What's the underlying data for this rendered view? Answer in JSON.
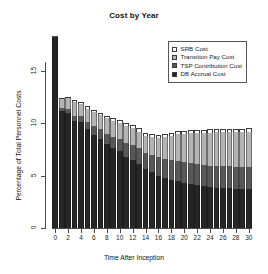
{
  "chart_data": {
    "type": "bar",
    "title": "Cost by Year",
    "xlabel": "Time After Inception",
    "ylabel": "Percentage of Total Personnel Costs",
    "stacked": true,
    "grid": false,
    "legend_position": "top-right",
    "xlim": [
      0,
      30
    ],
    "ylim": [
      0,
      18.6
    ],
    "ytick_labels": [
      "0",
      "5",
      "10",
      "15"
    ],
    "ytick_values": [
      0,
      5,
      10,
      15
    ],
    "xtick_labels": [
      "0",
      "2",
      "4",
      "6",
      "8",
      "10",
      "12",
      "14",
      "16",
      "18",
      "20",
      "22",
      "24",
      "26",
      "28",
      "30"
    ],
    "xtick_values": [
      0,
      2,
      4,
      6,
      8,
      10,
      12,
      14,
      16,
      18,
      20,
      22,
      24,
      26,
      28,
      30
    ],
    "categories": [
      0,
      1,
      2,
      3,
      4,
      5,
      6,
      7,
      8,
      9,
      10,
      11,
      12,
      13,
      14,
      15,
      16,
      17,
      18,
      19,
      20,
      21,
      22,
      23,
      24,
      25,
      26,
      27,
      28,
      29,
      30
    ],
    "series": [
      {
        "name": "DB Accrual Cost",
        "color": "#262626",
        "values": [
          18.2,
          11.2,
          11.0,
          10.2,
          10.1,
          9.4,
          8.9,
          8.5,
          8.0,
          7.6,
          7.3,
          6.8,
          6.5,
          6.1,
          5.6,
          5.3,
          5.0,
          4.8,
          4.6,
          4.5,
          4.3,
          4.2,
          4.1,
          4.0,
          3.9,
          3.85,
          3.8,
          3.78,
          3.75,
          3.72,
          3.7
        ]
      },
      {
        "name": "TSP Contribution Cost",
        "color": "#585858",
        "values": [
          0.1,
          0.25,
          0.4,
          0.5,
          0.6,
          0.7,
          0.8,
          0.9,
          1.0,
          1.1,
          1.2,
          1.3,
          1.4,
          1.5,
          1.6,
          1.7,
          1.75,
          1.8,
          1.85,
          1.9,
          1.95,
          2.0,
          2.02,
          2.04,
          2.06,
          2.08,
          2.1,
          2.1,
          2.1,
          2.1,
          2.1
        ]
      },
      {
        "name": "Transition Pay Cost",
        "color": "#b4b4b4",
        "values": [
          0.0,
          0.85,
          1.0,
          1.35,
          1.15,
          1.3,
          1.35,
          1.4,
          1.45,
          1.5,
          1.55,
          1.6,
          1.6,
          1.6,
          1.6,
          1.65,
          1.85,
          2.1,
          2.35,
          2.55,
          2.7,
          2.85,
          2.95,
          3.05,
          3.15,
          3.2,
          3.25,
          3.3,
          3.32,
          3.35,
          3.4
        ]
      },
      {
        "name": "SRB Cost",
        "color": "#ffffff",
        "values": [
          0.0,
          0.1,
          0.1,
          0.15,
          0.15,
          0.2,
          0.2,
          0.2,
          0.25,
          0.25,
          0.25,
          0.3,
          0.3,
          0.3,
          0.3,
          0.3,
          0.3,
          0.3,
          0.3,
          0.3,
          0.3,
          0.3,
          0.3,
          0.3,
          0.3,
          0.3,
          0.3,
          0.3,
          0.3,
          0.3,
          0.3
        ]
      }
    ],
    "totals": [
      18.3,
      12.4,
      12.5,
      12.2,
      12.0,
      11.6,
      11.25,
      11.0,
      10.7,
      10.45,
      10.3,
      10.0,
      9.8,
      9.5,
      9.1,
      8.95,
      8.9,
      9.0,
      9.1,
      9.25,
      9.25,
      9.35,
      9.37,
      9.39,
      9.41,
      9.43,
      9.45,
      9.48,
      9.47,
      9.47,
      9.5
    ]
  },
  "legend": {
    "items": [
      {
        "label": "SRB Cost",
        "swatch": "sw-srb"
      },
      {
        "label": "Transition Pay Cost",
        "swatch": "sw-trans"
      },
      {
        "label": "TSP Contribution Cost",
        "swatch": "sw-tsp"
      },
      {
        "label": "DB Accrual Cost",
        "swatch": "sw-db"
      }
    ]
  }
}
